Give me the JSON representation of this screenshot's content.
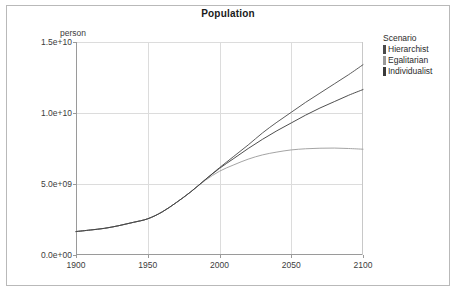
{
  "chart_data": {
    "type": "line",
    "title": "Population",
    "xlabel": "",
    "ylabel": "person",
    "ylim": [
      0,
      15000000000
    ],
    "xlim": [
      1900,
      2100
    ],
    "grid": true,
    "legend_position": "right",
    "legend_title": "Scenario",
    "x_ticks": [
      "1900",
      "1950",
      "2000",
      "2050",
      "2100"
    ],
    "x_tick_values": [
      1900,
      1950,
      2000,
      2050,
      2100
    ],
    "y_ticks": [
      "0.0e+00",
      "5.0e+09",
      "1.0e+10",
      "1.5e+10"
    ],
    "y_tick_values": [
      0,
      5000000000,
      10000000000,
      15000000000
    ],
    "x": [
      1900,
      1910,
      1920,
      1930,
      1940,
      1950,
      1960,
      1970,
      1980,
      1990,
      2000,
      2010,
      2020,
      2030,
      2040,
      2050,
      2060,
      2070,
      2080,
      2090,
      2100
    ],
    "series": [
      {
        "name": "Hierarchist",
        "color": "#4a4a4a",
        "values": [
          1650000000,
          1760000000,
          1880000000,
          2070000000,
          2300000000,
          2550000000,
          3030000000,
          3700000000,
          4450000000,
          5300000000,
          6150000000,
          6950000000,
          7750000000,
          8600000000,
          9350000000,
          10050000000,
          10750000000,
          11400000000,
          12050000000,
          12700000000,
          13400000000
        ]
      },
      {
        "name": "Egalitarian",
        "color": "#9a9a9a",
        "values": [
          1650000000,
          1760000000,
          1880000000,
          2070000000,
          2300000000,
          2550000000,
          3030000000,
          3700000000,
          4450000000,
          5250000000,
          5900000000,
          6350000000,
          6750000000,
          7050000000,
          7250000000,
          7400000000,
          7480000000,
          7520000000,
          7530000000,
          7500000000,
          7450000000
        ]
      },
      {
        "name": "Individualist",
        "color": "#3a3a3a",
        "values": [
          1650000000,
          1760000000,
          1880000000,
          2070000000,
          2300000000,
          2550000000,
          3030000000,
          3700000000,
          4450000000,
          5300000000,
          6100000000,
          6800000000,
          7500000000,
          8150000000,
          8750000000,
          9300000000,
          9850000000,
          10350000000,
          10800000000,
          11250000000,
          11650000000
        ]
      }
    ]
  },
  "legend": {
    "title": "Scenario",
    "items": [
      {
        "label": "Hierarchist",
        "color": "#4a4a4a"
      },
      {
        "label": "Egalitarian",
        "color": "#9a9a9a"
      },
      {
        "label": "Individualist",
        "color": "#3a3a3a"
      }
    ]
  },
  "colors": {
    "grid": "#dcdcdc",
    "axis": "#9a9a9a",
    "panel_background": "#ffffff",
    "frame_border": "#b9b9b9",
    "text": "#3c3c3c",
    "title_text": "#1a1a1a"
  }
}
